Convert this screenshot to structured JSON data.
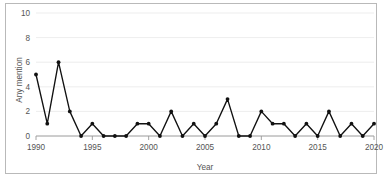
{
  "chart_data": {
    "type": "line",
    "title": "",
    "xlabel": "Year",
    "ylabel": "Any mention",
    "xlim": [
      1990,
      2020
    ],
    "ylim": [
      0,
      10
    ],
    "grid": true,
    "legend": "none",
    "marker": "filled-circle",
    "line_color": "#111111",
    "x": [
      1990,
      1991,
      1992,
      1993,
      1994,
      1995,
      1996,
      1997,
      1998,
      1999,
      2000,
      2001,
      2002,
      2003,
      2004,
      2005,
      2006,
      2007,
      2008,
      2009,
      2010,
      2011,
      2012,
      2013,
      2014,
      2015,
      2016,
      2017,
      2018,
      2019,
      2020
    ],
    "values": [
      5,
      1,
      6,
      2,
      0,
      1,
      0,
      0,
      0,
      1,
      1,
      0,
      2,
      0,
      1,
      0,
      1,
      3,
      0,
      0,
      2,
      1,
      1,
      0,
      1,
      0,
      2,
      0,
      1,
      0,
      1
    ],
    "xticks": [
      1990,
      1995,
      2000,
      2005,
      2010,
      2015,
      2020
    ],
    "xtick_labels": [
      "1990",
      "1995",
      "2000",
      "2005",
      "2010",
      "2015",
      "2020"
    ],
    "yticks": [
      0,
      2,
      4,
      6,
      8,
      10
    ],
    "ytick_labels": [
      "0",
      "2",
      "4",
      "6",
      "8",
      "10"
    ]
  },
  "axes": {
    "y_title": "Any mention",
    "x_title": "Year"
  },
  "colors": {
    "series": "#111111",
    "grid": "#e8e8e8",
    "axis": "#9a9a9a",
    "text": "#555555",
    "frame": "#b9b9b9",
    "background": "#ffffff"
  }
}
